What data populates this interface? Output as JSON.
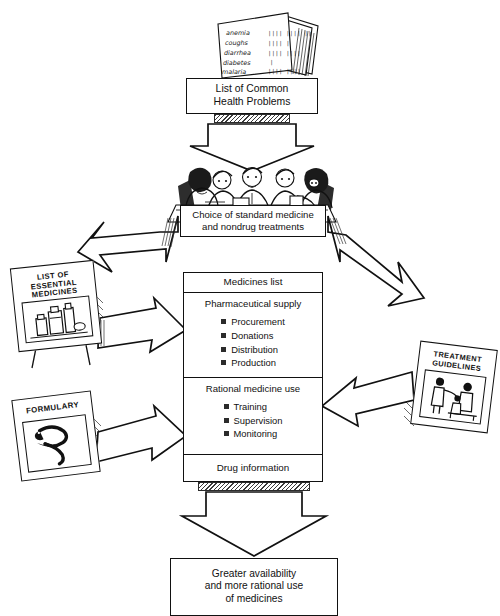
{
  "diagram": {
    "background_color": "#ffffff",
    "ink_color": "#111111",
    "bullet_color": "#2b2b2b"
  },
  "top_papers": {
    "name": "stack-of-health-problem-papers",
    "entries": [
      {
        "label": "anemia",
        "tally": "|||| |||| ||"
      },
      {
        "label": "coughs",
        "tally": "|||| |"
      },
      {
        "label": "diarrhea",
        "tally": "|||| ||||"
      },
      {
        "label": "diabetes",
        "tally": "|"
      },
      {
        "label": "malaria",
        "tally": "|||| ||||"
      }
    ]
  },
  "health_problems_box": {
    "line1": "List of Common",
    "line2": "Health Problems"
  },
  "meeting": {
    "caption_line1": "Choice of standard medicine",
    "caption_line2": "and nondrug treatments",
    "people_count": 5
  },
  "essential_medicines_card": {
    "line1": "LIST OF",
    "line2": "ESSENTIAL",
    "line3": "MEDICINES",
    "illustration": "medicine-bottles"
  },
  "formulary_card": {
    "line1": "FORMULARY",
    "illustration": "snake-and-staff"
  },
  "guidelines_card": {
    "line1": "TREATMENT",
    "line2": "GUIDELINES",
    "illustration": "clinician-and-patients"
  },
  "medicines_list": {
    "title": "Medicines list",
    "supply": {
      "heading": "Pharmaceutical supply",
      "items": [
        "Procurement",
        "Donations",
        "Distribution",
        "Production"
      ]
    },
    "rational_use": {
      "heading": "Rational medicine use",
      "items": [
        "Training",
        "Supervision",
        "Monitoring"
      ]
    },
    "footer": "Drug information"
  },
  "outcome_box": {
    "line1": "Greater availability",
    "line2": "and more rational use",
    "line3": "of medicines"
  }
}
